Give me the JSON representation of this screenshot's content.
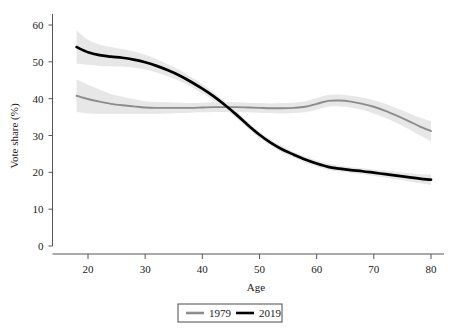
{
  "chart_data": {
    "type": "line",
    "title": "",
    "xlabel": "Age",
    "ylabel": "Vote share (%)",
    "xlim": [
      15,
      82
    ],
    "ylim": [
      0,
      63
    ],
    "xticks": [
      20,
      30,
      40,
      50,
      60,
      70,
      80
    ],
    "yticks": [
      0,
      10,
      20,
      30,
      40,
      50,
      60
    ],
    "xtick_labels": [
      "20",
      "30",
      "40",
      "50",
      "60",
      "70",
      "80"
    ],
    "ytick_labels": [
      "0",
      "10",
      "20",
      "30",
      "40",
      "50",
      "60"
    ],
    "grid": false,
    "legend_position": "bottom-center",
    "x": [
      18,
      20,
      22,
      24,
      26,
      28,
      30,
      32,
      34,
      36,
      38,
      40,
      42,
      44,
      46,
      48,
      50,
      52,
      54,
      56,
      58,
      60,
      62,
      64,
      66,
      68,
      70,
      72,
      74,
      76,
      78,
      80
    ],
    "series": [
      {
        "name": "1979",
        "color": "#8c8c8c",
        "values": [
          40.8,
          39.9,
          39.2,
          38.6,
          38.2,
          37.9,
          37.6,
          37.5,
          37.5,
          37.5,
          37.5,
          37.6,
          37.7,
          37.7,
          37.7,
          37.6,
          37.5,
          37.4,
          37.4,
          37.5,
          37.8,
          38.6,
          39.4,
          39.5,
          39.2,
          38.6,
          37.8,
          36.7,
          35.4,
          34.0,
          32.5,
          31.2
        ],
        "ci_lower": [
          36.3,
          36.0,
          35.9,
          35.9,
          35.9,
          35.9,
          35.9,
          35.9,
          36.0,
          36.1,
          36.2,
          36.3,
          36.4,
          36.4,
          36.4,
          36.3,
          36.2,
          36.1,
          36.0,
          36.1,
          36.3,
          37.0,
          37.8,
          37.9,
          37.6,
          36.9,
          36.0,
          34.8,
          33.4,
          31.8,
          30.1,
          28.5
        ],
        "ci_upper": [
          45.3,
          43.8,
          42.5,
          41.3,
          40.5,
          39.9,
          39.3,
          39.1,
          39.0,
          38.9,
          38.8,
          38.9,
          39.0,
          39.0,
          39.0,
          38.9,
          38.8,
          38.7,
          38.8,
          38.9,
          39.3,
          40.2,
          41.0,
          41.1,
          40.8,
          40.3,
          39.6,
          38.6,
          37.4,
          36.2,
          34.9,
          33.9
        ]
      },
      {
        "name": "2019",
        "color": "#000000",
        "values": [
          54.0,
          52.6,
          51.8,
          51.4,
          51.1,
          50.6,
          49.9,
          48.9,
          47.7,
          46.3,
          44.6,
          42.7,
          40.6,
          38.2,
          35.6,
          32.8,
          30.2,
          28.0,
          26.2,
          24.8,
          23.5,
          22.4,
          21.5,
          21.0,
          20.6,
          20.3,
          19.9,
          19.5,
          19.1,
          18.7,
          18.3,
          18.0
        ],
        "ci_lower": [
          49.5,
          49.2,
          48.9,
          48.8,
          48.7,
          48.4,
          47.9,
          47.1,
          46.1,
          44.8,
          43.3,
          41.5,
          39.5,
          37.2,
          34.7,
          32.0,
          29.4,
          27.2,
          25.4,
          24.0,
          22.7,
          21.6,
          20.7,
          20.2,
          19.8,
          19.5,
          19.1,
          18.6,
          18.1,
          17.6,
          17.1,
          16.6
        ],
        "ci_upper": [
          58.5,
          56.0,
          54.7,
          54.0,
          53.5,
          52.8,
          51.9,
          50.7,
          49.3,
          47.8,
          45.9,
          43.9,
          41.7,
          39.2,
          36.5,
          33.6,
          31.0,
          28.8,
          27.0,
          25.6,
          24.3,
          23.2,
          22.3,
          21.8,
          21.4,
          21.1,
          20.7,
          20.4,
          20.1,
          19.8,
          19.5,
          19.4
        ]
      }
    ],
    "legend": [
      {
        "label": "1979",
        "color": "#8c8c8c"
      },
      {
        "label": "2019",
        "color": "#000000"
      }
    ]
  },
  "colors": {
    "background": "#ffffff",
    "axis": "#555555",
    "band": "#e7e7e7",
    "legend_border": "#4a4a4a"
  }
}
